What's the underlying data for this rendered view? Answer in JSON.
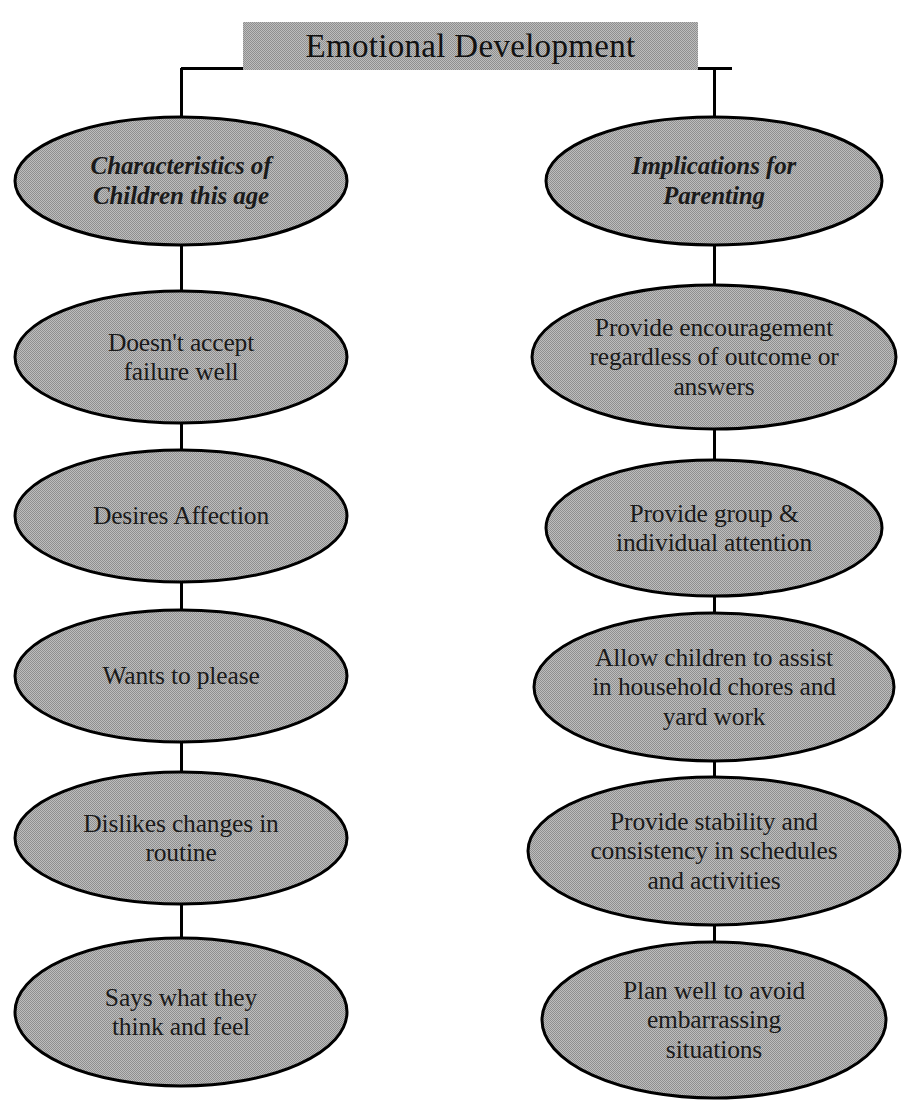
{
  "diagram": {
    "title": "Emotional Development",
    "title_box": {
      "fill": "#a9a9a9",
      "x": 243,
      "y": 22,
      "width": 455,
      "height": 48
    },
    "ellipse_fill": "#a9a9a9",
    "stroke": "#000000",
    "connector_color": "#000000",
    "columns": [
      {
        "id": "left",
        "center_x": 181,
        "header": {
          "lines": [
            "Characteristics of",
            "Children this age"
          ],
          "cx": 181,
          "cy": 181,
          "rx": 166,
          "ry": 64
        },
        "nodes": [
          {
            "lines": [
              "Doesn't accept",
              "failure well"
            ],
            "cx": 181,
            "cy": 357,
            "rx": 166,
            "ry": 66
          },
          {
            "lines": [
              "Desires Affection"
            ],
            "cx": 181,
            "cy": 516,
            "rx": 166,
            "ry": 66
          },
          {
            "lines": [
              "Wants to please"
            ],
            "cx": 181,
            "cy": 676,
            "rx": 166,
            "ry": 66
          },
          {
            "lines": [
              "Dislikes changes in",
              "routine"
            ],
            "cx": 181,
            "cy": 838,
            "rx": 166,
            "ry": 66
          },
          {
            "lines": [
              "Says what they",
              "think and feel"
            ],
            "cx": 181,
            "cy": 1012,
            "rx": 166,
            "ry": 74
          }
        ]
      },
      {
        "id": "right",
        "center_x": 714,
        "header": {
          "lines": [
            "Implications for",
            "Parenting"
          ],
          "cx": 714,
          "cy": 181,
          "rx": 168,
          "ry": 64
        },
        "nodes": [
          {
            "lines": [
              "Provide encouragement",
              "regardless of outcome or",
              "answers"
            ],
            "cx": 714,
            "cy": 357,
            "rx": 182,
            "ry": 72
          },
          {
            "lines": [
              "Provide group &",
              "individual attention"
            ],
            "cx": 714,
            "cy": 528,
            "rx": 168,
            "ry": 68
          },
          {
            "lines": [
              "Allow children to assist",
              "in household chores and",
              "yard work"
            ],
            "cx": 714,
            "cy": 687,
            "rx": 180,
            "ry": 74
          },
          {
            "lines": [
              "Provide stability and",
              "consistency in schedules",
              "and activities"
            ],
            "cx": 714,
            "cy": 851,
            "rx": 186,
            "ry": 74
          },
          {
            "lines": [
              "Plan well to avoid",
              "embarrassing",
              "situations"
            ],
            "cx": 714,
            "cy": 1020,
            "rx": 172,
            "ry": 78
          }
        ]
      }
    ],
    "connectors": {
      "trunk_y": 68,
      "trunk_x1": 181,
      "trunk_x2": 732,
      "description": "Horizontal trunk under title box branching down to both column headers, then vertical links between consecutive ellipses."
    }
  }
}
